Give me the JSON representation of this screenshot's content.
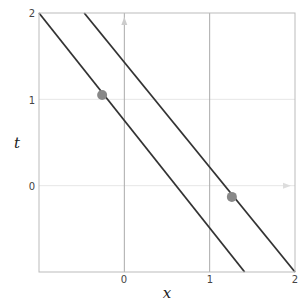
{
  "chart_data": {
    "type": "line",
    "title": "",
    "xlabel": "x",
    "ylabel": "t",
    "xlim": [
      -1,
      2
    ],
    "ylim": [
      -1,
      2
    ],
    "xticks": [
      0,
      1,
      2
    ],
    "yticks": [
      0,
      1,
      2
    ],
    "grid": true,
    "legend": null,
    "series": [
      {
        "name": "line-1",
        "kind": "line",
        "color": "#333333",
        "points": [
          [
            -1.0,
            2.0
          ],
          [
            1.41,
            -1.0
          ]
        ]
      },
      {
        "name": "line-2",
        "kind": "line",
        "color": "#333333",
        "points": [
          [
            -0.47,
            2.0
          ],
          [
            2.0,
            -1.0
          ]
        ]
      },
      {
        "name": "events",
        "kind": "scatter",
        "color": "#888888",
        "points": [
          [
            -0.26,
            1.05
          ],
          [
            1.26,
            -0.13
          ]
        ]
      }
    ]
  },
  "axes": {
    "x_label": "x",
    "y_label": "t",
    "x_tick_labels": [
      "0",
      "1",
      "2"
    ],
    "y_tick_labels": [
      "0",
      "1",
      "2"
    ]
  },
  "colors": {
    "frame": "#bbbbbb",
    "grid": "#e6e6e6",
    "axis_line": "#aaaaaa",
    "line": "#333333",
    "point": "#888888"
  }
}
